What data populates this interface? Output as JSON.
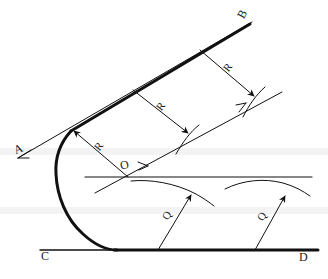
{
  "figure": {
    "type": "technical-line-drawing",
    "background_color": "#ffffff",
    "ink_color": "#111111",
    "labels": [
      {
        "id": "A",
        "text": "A",
        "x": 14,
        "y": 143,
        "rotation": -22,
        "role": "line-endpoint-label"
      },
      {
        "id": "B",
        "text": "B",
        "x": 238,
        "y": 8,
        "rotation": -60,
        "role": "line-endpoint-label"
      },
      {
        "id": "C",
        "text": "C",
        "x": 41,
        "y": 250,
        "rotation": 0,
        "role": "line-endpoint-label"
      },
      {
        "id": "D",
        "text": "D",
        "x": 299,
        "y": 251,
        "rotation": 0,
        "role": "line-endpoint-label"
      },
      {
        "id": "O",
        "text": "O",
        "x": 120,
        "y": 159,
        "rotation": -10,
        "role": "center-point-label"
      },
      {
        "id": "R1",
        "text": "R",
        "x": 95,
        "y": 141,
        "rotation": -55,
        "role": "radius-label"
      },
      {
        "id": "R2",
        "text": "R",
        "x": 157,
        "y": 101,
        "rotation": -55,
        "role": "radius-label"
      },
      {
        "id": "R3",
        "text": "R",
        "x": 224,
        "y": 62,
        "rotation": -55,
        "role": "radius-label"
      },
      {
        "id": "Q1",
        "text": "Q",
        "x": 163,
        "y": 210,
        "rotation": -55,
        "role": "radius-label"
      },
      {
        "id": "Q2",
        "text": "Q",
        "x": 258,
        "y": 211,
        "rotation": -55,
        "role": "radius-label"
      }
    ],
    "geometry": {
      "line_AB": {
        "from": [
          18,
          158
        ],
        "to": [
          252,
          22
        ],
        "stroke_width": 1,
        "note": "thin construction line A to B direction"
      },
      "line_AB_thick": {
        "from": [
          72,
          130
        ],
        "to": [
          250,
          24
        ],
        "stroke_width": 3,
        "note": "heavy upper tangent segment ending at B"
      },
      "line_CD": {
        "from": [
          40,
          250
        ],
        "to": [
          318,
          250
        ],
        "stroke_width": 1.5,
        "note": "baseline C to D"
      },
      "line_CD_thick": {
        "from": [
          115,
          250
        ],
        "to": [
          318,
          250
        ],
        "stroke_width": 3,
        "note": "heavy lower tangent segment"
      },
      "main_curve": {
        "note": "thick hook curve tangent to AB at upper left and to CD at bottom"
      },
      "horizontal_mid_line": {
        "from": [
          85,
          177
        ],
        "to": [
          312,
          177
        ],
        "stroke_width": 1.2
      },
      "offset_tangent_line": {
        "from": [
          95,
          193
        ],
        "to": [
          282,
          92
        ],
        "stroke_width": 1
      },
      "radius_arrows": [
        {
          "label": "R",
          "from": [
            72,
            130
          ],
          "to": [
            128,
            177
          ],
          "reversed": true
        },
        {
          "label": "R",
          "from": [
            133,
            90
          ],
          "to": [
            188,
            133
          ]
        },
        {
          "label": "R",
          "from": [
            200,
            50
          ],
          "to": [
            254,
            96
          ]
        },
        {
          "label": "Q",
          "from": [
            158,
            250
          ],
          "to": [
            190,
            194
          ]
        },
        {
          "label": "Q",
          "from": [
            255,
            250
          ],
          "to": [
            284,
            195
          ]
        }
      ],
      "arcs": [
        {
          "note": "small arc crossing upper R arrowhead near (188,133)"
        },
        {
          "note": "small arc crossing upper R arrowhead near (254,96)"
        },
        {
          "note": "lower arc left of centre from (133,180) to (212,193)"
        },
        {
          "note": "lower arc right from (228,189) to (305,184)"
        }
      ]
    }
  }
}
